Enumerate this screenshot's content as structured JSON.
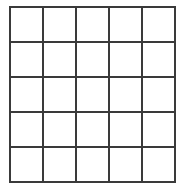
{
  "grid": {
    "rows": 5,
    "cols": 5,
    "line_color": "#3a3a3a",
    "background_color": "#ffffff",
    "cells": [
      [
        "",
        "",
        "",
        "",
        ""
      ],
      [
        "",
        "",
        "",
        "",
        ""
      ],
      [
        "",
        "",
        "",
        "",
        ""
      ],
      [
        "",
        "",
        "",
        "",
        ""
      ],
      [
        "",
        "",
        "",
        "",
        ""
      ]
    ]
  }
}
